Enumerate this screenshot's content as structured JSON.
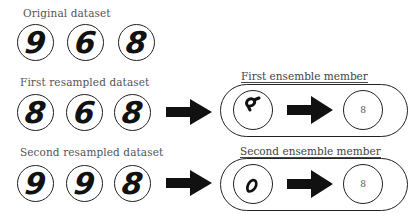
{
  "rows": [
    {
      "label": "Original dataset",
      "digits": [
        "9",
        "6",
        "8"
      ]
    },
    {
      "label": "First resampled dataset",
      "digits": [
        "8",
        "6",
        "8"
      ],
      "ensemble": {
        "label": "First ensemble member",
        "feature_glyph": "partial-loop-with-stroke",
        "prediction": "8"
      }
    },
    {
      "label": "Second resampled dataset",
      "digits": [
        "9",
        "9",
        "8"
      ],
      "ensemble": {
        "label": "Second ensemble member",
        "feature_glyph": "lower-loop",
        "prediction": "8"
      }
    }
  ],
  "icons": {
    "arrow": "right-block-arrow"
  },
  "colors": {
    "ink": "#111111",
    "stroke": "#222222",
    "label_text": "#555555"
  }
}
